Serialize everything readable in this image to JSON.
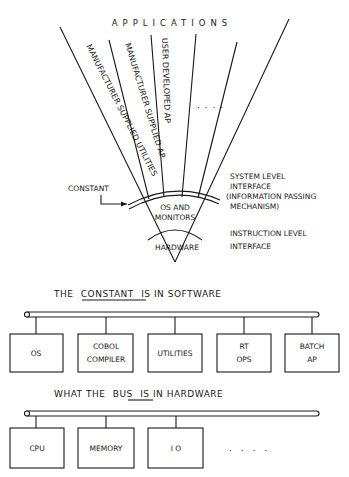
{
  "fan": {
    "title": "APPLICATIONS",
    "wedges": [
      {
        "label": "MANUFACTURER SUPPLIED UTILITIES"
      },
      {
        "label": "MANUFACTURER SUPPLIED AP"
      },
      {
        "label": "USER DEVELOPED AP"
      },
      {
        "label": ""
      },
      {
        "label": ". . . ."
      },
      {
        "label": ""
      }
    ],
    "constant_label": "CONSTANT",
    "os_label_line1": "OS AND",
    "os_label_line2": "MONITORS",
    "hardware_label": "HARDWARE",
    "system_interface": {
      "line1": "SYSTEM LEVEL",
      "line2": "INTERFACE",
      "line3": "(INFORMATION PASSING",
      "line4": "MECHANISM)"
    },
    "instruction_interface": {
      "line1": "INSTRUCTION LEVEL",
      "line2": "INTERFACE"
    }
  },
  "software": {
    "heading_pre": "THE",
    "heading_key": "CONSTANT",
    "heading_post": "IS IN SOFTWARE",
    "boxes": [
      {
        "line1": "OS",
        "line2": ""
      },
      {
        "line1": "COBOL",
        "line2": "COMPILER"
      },
      {
        "line1": "UTILITIES",
        "line2": ""
      },
      {
        "line1": "RT",
        "line2": "OPS"
      },
      {
        "line1": "BATCH",
        "line2": "AP"
      }
    ]
  },
  "hardware": {
    "heading_pre": "WHAT THE",
    "heading_key": "BUS",
    "heading_post": "IS IN HARDWARE",
    "boxes": [
      {
        "line1": "CPU"
      },
      {
        "line1": "MEMORY"
      },
      {
        "line1": "I O"
      }
    ],
    "ellipsis": ". . . ."
  }
}
